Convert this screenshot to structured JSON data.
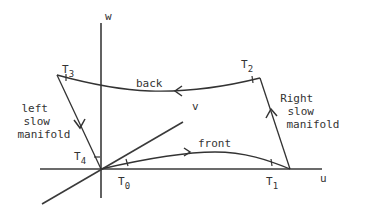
{
  "axes": {
    "u": "u",
    "v": "v",
    "w": "w"
  },
  "points": {
    "T0": {
      "letter": "T",
      "sub": "0"
    },
    "T1": {
      "letter": "T",
      "sub": "1"
    },
    "T2": {
      "letter": "T",
      "sub": "2"
    },
    "T3": {
      "letter": "T",
      "sub": "3"
    },
    "T4": {
      "letter": "T",
      "sub": "4"
    }
  },
  "segments": {
    "front": "front",
    "back": "back",
    "left_manifold": [
      "left",
      "slow",
      "manifold"
    ],
    "right_manifold": [
      "Right",
      "slow",
      "manifold"
    ]
  },
  "colors": {
    "ink": "#333333",
    "background": "#ffffff"
  }
}
